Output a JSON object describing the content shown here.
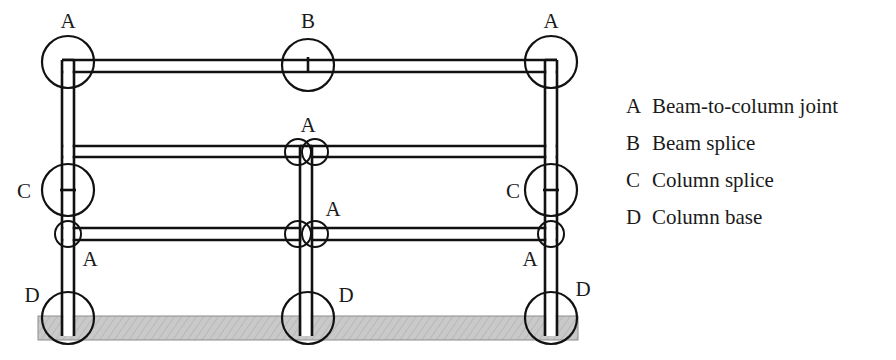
{
  "figure": {
    "title_visible": false,
    "colors": {
      "line": "#111111",
      "ground_fill": "#c9c9c9",
      "ground_stroke": "#8d8d8d",
      "background": "#ffffff",
      "text": "#1a1a1a"
    },
    "ground": {
      "label": "ground-hatch-band",
      "x": 38,
      "y": 316,
      "width": 540,
      "height": 24
    },
    "columns": [
      {
        "name": "left-column",
        "x_outer": 62,
        "x_inner": 74,
        "y_top": 60,
        "y_bottom": 336
      },
      {
        "name": "middle-column",
        "x_outer": 300,
        "x_inner": 312,
        "y_top": 146,
        "y_bottom": 336
      },
      {
        "name": "right-column",
        "x_outer": 545,
        "x_inner": 557,
        "y_top": 60,
        "y_bottom": 336
      }
    ],
    "beams": [
      {
        "name": "roof-beam",
        "x_left": 62,
        "x_right": 557,
        "y_top": 60,
        "y_bottom": 72
      },
      {
        "name": "upper-floor-beam",
        "x_left": 62,
        "x_right": 557,
        "y_top": 146,
        "y_bottom": 157
      },
      {
        "name": "lower-floor-beam",
        "x_left": 62,
        "x_right": 557,
        "y_top": 228,
        "y_bottom": 240
      }
    ],
    "markers": [
      {
        "name": "marker-a-top-left",
        "key": "A",
        "kind": "large-circle",
        "cx": 68,
        "cy": 62,
        "r": 26,
        "tick": "none",
        "label_x": 68,
        "label_y": 28,
        "label_anchor": "middle"
      },
      {
        "name": "marker-b-beam-splice",
        "key": "B",
        "kind": "large-circle",
        "cx": 308,
        "cy": 65,
        "r": 26,
        "tick": "vertical",
        "label_x": 308,
        "label_y": 28,
        "label_anchor": "middle"
      },
      {
        "name": "marker-a-top-right",
        "key": "A",
        "kind": "large-circle",
        "cx": 551,
        "cy": 62,
        "r": 26,
        "tick": "none",
        "label_x": 551,
        "label_y": 28,
        "label_anchor": "middle"
      },
      {
        "name": "marker-c-splice-left",
        "key": "C",
        "kind": "large-circle",
        "cx": 68,
        "cy": 190,
        "r": 26,
        "tick": "horizontal",
        "label_x": 24,
        "label_y": 198,
        "label_anchor": "middle"
      },
      {
        "name": "marker-c-splice-right",
        "key": "C",
        "kind": "large-circle",
        "cx": 551,
        "cy": 190,
        "r": 26,
        "tick": "horizontal",
        "label_x": 513,
        "label_y": 198,
        "label_anchor": "middle"
      },
      {
        "name": "marker-d-base-left",
        "key": "D",
        "kind": "large-circle",
        "cx": 68,
        "cy": 318,
        "r": 26,
        "tick": "none",
        "label_x": 32,
        "label_y": 302,
        "label_anchor": "middle"
      },
      {
        "name": "marker-d-base-middle",
        "key": "D",
        "kind": "large-circle",
        "cx": 308,
        "cy": 318,
        "r": 26,
        "tick": "none",
        "label_x": 346,
        "label_y": 302,
        "label_anchor": "middle"
      },
      {
        "name": "marker-d-base-right",
        "key": "D",
        "kind": "large-circle",
        "cx": 551,
        "cy": 318,
        "r": 26,
        "tick": "none",
        "label_x": 583,
        "label_y": 296,
        "label_anchor": "middle"
      },
      {
        "name": "marker-a-mid-upper-left",
        "key": "",
        "kind": "small-circle",
        "cx": 298,
        "cy": 152,
        "r": 13,
        "tick": "none",
        "label_x": 0,
        "label_y": 0,
        "label_anchor": "middle"
      },
      {
        "name": "marker-a-mid-upper-right",
        "key": "A",
        "kind": "small-circle",
        "cx": 315,
        "cy": 152,
        "r": 13,
        "tick": "none",
        "label_x": 308,
        "label_y": 132,
        "label_anchor": "middle"
      },
      {
        "name": "marker-a-mid-lower-left",
        "key": "",
        "kind": "small-circle",
        "cx": 298,
        "cy": 234,
        "r": 13,
        "tick": "none",
        "label_x": 0,
        "label_y": 0,
        "label_anchor": "middle"
      },
      {
        "name": "marker-a-mid-lower-right",
        "key": "A",
        "kind": "small-circle",
        "cx": 315,
        "cy": 234,
        "r": 13,
        "tick": "none",
        "label_x": 333,
        "label_y": 216,
        "label_anchor": "middle"
      },
      {
        "name": "marker-a-lower-left",
        "key": "A",
        "kind": "small-circle",
        "cx": 68,
        "cy": 234,
        "r": 13,
        "tick": "none",
        "label_x": 90,
        "label_y": 266,
        "label_anchor": "middle"
      },
      {
        "name": "marker-a-lower-right",
        "key": "A",
        "kind": "small-circle",
        "cx": 551,
        "cy": 234,
        "r": 13,
        "tick": "none",
        "label_x": 530,
        "label_y": 266,
        "label_anchor": "middle"
      }
    ]
  },
  "legend": {
    "items": [
      {
        "key": "A",
        "desc": "Beam-to-column joint"
      },
      {
        "key": "B",
        "desc": "Beam splice"
      },
      {
        "key": "C",
        "desc": "Column splice"
      },
      {
        "key": "D",
        "desc": "Column base"
      }
    ]
  }
}
